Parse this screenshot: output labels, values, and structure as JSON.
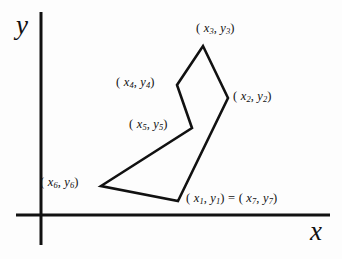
{
  "figure": {
    "background_color": "#fdfdfd",
    "ink_color": "#111111"
  },
  "axes": {
    "x_label": "x",
    "y_label": "y",
    "origin": {
      "x": 41,
      "y": 215
    },
    "x_axis": {
      "x1": 16,
      "y1": 215,
      "x2": 330,
      "y2": 215
    },
    "y_axis": {
      "x1": 41,
      "y1": 12,
      "x2": 41,
      "y2": 245
    }
  },
  "labels": [
    {
      "id": "p3",
      "prefix": "(",
      "var1": "x",
      "sub1": "3",
      "sep": ",",
      "var2": "y",
      "sub2": "3",
      "suffix": ")",
      "text": "( x3 , y3 )"
    },
    {
      "id": "p4",
      "prefix": "(",
      "var1": "x",
      "sub1": "4",
      "sep": ",",
      "var2": "y",
      "sub2": "4",
      "suffix": ")",
      "text": "( x4 , y4 )"
    },
    {
      "id": "p2",
      "prefix": "(",
      "var1": "x",
      "sub1": "2",
      "sep": ",",
      "var2": "y",
      "sub2": "2",
      "suffix": ")",
      "text": "( x2 , y2 )"
    },
    {
      "id": "p5",
      "prefix": "(",
      "var1": "x",
      "sub1": "5",
      "sep": ",",
      "var2": "y",
      "sub2": "5",
      "suffix": ")",
      "text": "( x5 , y5 )"
    },
    {
      "id": "p6",
      "prefix": "(",
      "var1": "x",
      "sub1": "6",
      "sep": ",",
      "var2": "y",
      "sub2": "6",
      "suffix": ")",
      "text": "( x6 , y6 )"
    },
    {
      "id": "p1",
      "prefix": "(",
      "var1": "x",
      "sub1": "1",
      "sep": ",",
      "var2": "y",
      "sub2": "1",
      "suffix": ")",
      "equals": "=",
      "prefix2": "(",
      "var3": "x",
      "sub3": "7",
      "var4": "y",
      "sub4": "7",
      "suffix2": ")",
      "text": "( x1 , y1 ) = ( x7 , y7 )"
    }
  ],
  "label_parts": {
    "open_paren": "(",
    "comma": ",",
    "close_paren": ")",
    "equals": "=",
    "x_var": "x",
    "y_var": "y",
    "s1": "1",
    "s2": "2",
    "s3": "3",
    "s4": "4",
    "s5": "5",
    "s6": "6",
    "s7": "7"
  },
  "chart_data": {
    "type": "scatter",
    "xlabel": "x",
    "ylabel": "y",
    "grid": false,
    "legend": "none",
    "closed": true,
    "note": "Vertex 7 coincides with vertex 1, closing the polygon.",
    "vertex_names": [
      "(x1,y1)",
      "(x2,y2)",
      "(x3,y3)",
      "(x4,y4)",
      "(x5,y5)",
      "(x6,y6)",
      "(x7,y7)"
    ],
    "pixel_vertices": [
      {
        "name": "(x1,y1)",
        "px": 178,
        "py": 201
      },
      {
        "name": "(x2,y2)",
        "px": 228,
        "py": 98
      },
      {
        "name": "(x3,y3)",
        "px": 203,
        "py": 46
      },
      {
        "name": "(x4,y4)",
        "px": 177,
        "py": 85
      },
      {
        "name": "(x5,y5)",
        "px": 192,
        "py": 128
      },
      {
        "name": "(x6,y6)",
        "px": 101,
        "py": 186
      },
      {
        "name": "(x7,y7)",
        "px": 178,
        "py": 201
      }
    ],
    "x": [
      137,
      187,
      162,
      136,
      151,
      60,
      137
    ],
    "y": [
      14,
      117,
      169,
      130,
      87,
      29,
      14
    ],
    "xlim": [
      0,
      289
    ],
    "ylim": [
      0,
      203
    ]
  }
}
